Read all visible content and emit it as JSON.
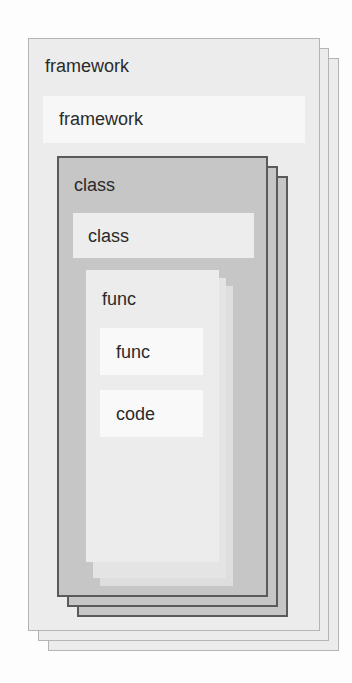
{
  "diagram": {
    "framework": {
      "title": "framework",
      "inner_label": "framework",
      "stack_count": 3,
      "colors": {
        "fill": "#ececec",
        "border": "#b4b4b4",
        "strip": "#f7f7f7"
      }
    },
    "class": {
      "title": "class",
      "inner_label": "class",
      "stack_count": 3,
      "colors": {
        "fill": "#c6c6c6",
        "border": "#5a5a5a",
        "strip": "#ededed"
      }
    },
    "func": {
      "title": "func",
      "items": [
        {
          "label": "func"
        },
        {
          "label": "code"
        }
      ],
      "stack_count": 3,
      "colors": {
        "fill": "#ebebeb",
        "item": "#f9f9f9"
      }
    }
  }
}
